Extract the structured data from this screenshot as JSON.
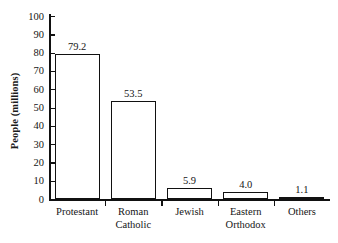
{
  "chart_data": {
    "type": "bar",
    "title": "",
    "subtitle": "",
    "xlabel": "",
    "ylabel": "People (millions)",
    "categories": [
      "Protestant",
      "Roman\nCatholic",
      "Jewish",
      "Eastern\nOrthodox",
      "Others"
    ],
    "values": [
      79.2,
      53.5,
      5.9,
      4.0,
      1.1
    ],
    "value_labels": [
      "79.2",
      "53.5",
      "5.9",
      "4.0",
      "1.1"
    ],
    "ylim": [
      0,
      100
    ],
    "y_ticks": [
      0,
      10,
      20,
      30,
      40,
      50,
      60,
      70,
      80,
      90,
      100
    ],
    "y_tick_labels": [
      "0",
      "10",
      "20",
      "30",
      "40",
      "50",
      "60",
      "70",
      "80",
      "90",
      "100"
    ],
    "grid": false,
    "legend": null,
    "bar_fill_color": "#ffffff",
    "bar_edge_color": "#111111",
    "axis_color": "#111111",
    "text_color": "#151515",
    "background_color": "#ffffff"
  }
}
